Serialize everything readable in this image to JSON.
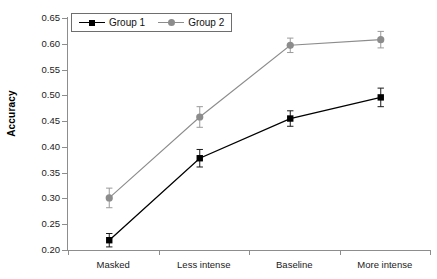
{
  "chart_data": {
    "type": "line",
    "title": "",
    "xlabel": "",
    "ylabel": "Accuracy",
    "categories": [
      "Masked",
      "Less intense",
      "Baseline",
      "More intense"
    ],
    "ylim": [
      0.2,
      0.65
    ],
    "ytick_step": 0.05,
    "ytick_labels": [
      "0.20",
      "0.25",
      "0.30",
      "0.35",
      "0.40",
      "0.45",
      "0.50",
      "0.55",
      "0.60",
      "0.65"
    ],
    "ytick_values": [
      0.2,
      0.25,
      0.3,
      0.35,
      0.4,
      0.45,
      0.5,
      0.55,
      0.6,
      0.65
    ],
    "grid": false,
    "legend_position": "top-left",
    "series": [
      {
        "name": "Group 1",
        "color": "#000000",
        "marker": "square",
        "values": [
          0.219,
          0.378,
          0.455,
          0.496
        ],
        "errors": [
          0.013,
          0.017,
          0.015,
          0.018
        ]
      },
      {
        "name": "Group 2",
        "color": "#8c8c8c",
        "marker": "circle",
        "values": [
          0.301,
          0.458,
          0.597,
          0.608
        ],
        "errors": [
          0.019,
          0.02,
          0.014,
          0.016
        ]
      }
    ]
  },
  "axis": {
    "y_title": "Accuracy"
  },
  "legend": {
    "items": [
      {
        "label": "Group 1"
      },
      {
        "label": "Group 2"
      }
    ]
  },
  "caption": {
    "text": ""
  },
  "colors": {
    "group1": "#000000",
    "group2": "#8c8c8c",
    "axis": "#8d8d8d",
    "text": "#1a1a1a"
  }
}
